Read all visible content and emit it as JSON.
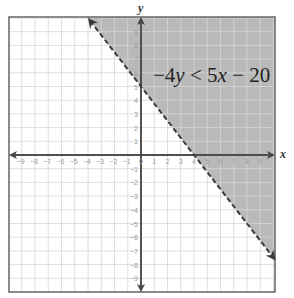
{
  "chart_data": {
    "type": "inequality-graph",
    "title": "",
    "inequality": "−4y < 5x − 20",
    "inequality_parts": {
      "lhs_coef": "−4",
      "lhs_var": "y",
      "op": " < ",
      "rhs_coef": "5",
      "rhs_var": "x",
      "rhs_rest": " − 20"
    },
    "boundary_line": {
      "slope": -1.25,
      "y_intercept": 5,
      "x_intercept": 4,
      "style": "dashed",
      "points": [
        [
          0,
          5
        ],
        [
          4,
          0
        ]
      ]
    },
    "shaded_region": "above the line (y > -5/4 x + 5)",
    "xlabel": "x",
    "ylabel": "y",
    "xlim": [
      -9,
      9
    ],
    "ylim": [
      -9,
      9
    ],
    "x_ticks": [
      -9,
      -8,
      -7,
      -6,
      -5,
      -4,
      -3,
      -2,
      -1,
      0,
      1,
      2,
      3,
      4,
      5,
      6,
      7,
      8,
      9
    ],
    "y_ticks": [
      9,
      8,
      7,
      6,
      5,
      4,
      3,
      2,
      1,
      -1,
      -2,
      -3,
      -4,
      -5,
      -6,
      -7,
      -8,
      -9
    ],
    "grid": true,
    "colors": {
      "shade": "#b9b9b9",
      "grid": "#d6d6d6",
      "axis": "#444444",
      "border": "#6e6e6e",
      "line": "#3a3a3a"
    }
  },
  "labels": {
    "x_axis": "x",
    "y_axis": "y"
  }
}
